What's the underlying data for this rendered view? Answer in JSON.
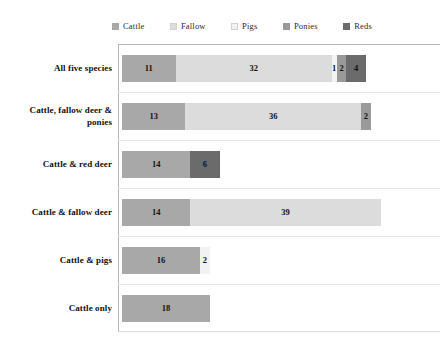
{
  "chart_data": {
    "type": "bar",
    "orientation": "horizontal",
    "stacked": true,
    "title": "",
    "subtitle": "",
    "xlabel": "",
    "ylabel": "",
    "xlim": [
      0,
      66
    ],
    "grid": false,
    "legend_position": "top",
    "categories": [
      "All five species",
      "Cattle, fallow deer & ponies",
      "Cattle & red deer",
      "Cattle & fallow deer",
      "Cattle & pigs",
      "Cattle only"
    ],
    "series": [
      {
        "name": "Cattle",
        "color": "#a8a8a8",
        "values": [
          11,
          13,
          14,
          14,
          16,
          18
        ]
      },
      {
        "name": "Fallow",
        "color": "#dcdcdc",
        "values": [
          32,
          36,
          0,
          39,
          0,
          0
        ]
      },
      {
        "name": "Pigs",
        "color": "#f2f2f2",
        "values": [
          1,
          0,
          0,
          0,
          2,
          0
        ]
      },
      {
        "name": "Ponies",
        "color": "#9a9a9a",
        "values": [
          2,
          2,
          0,
          0,
          0,
          0
        ]
      },
      {
        "name": "Reds",
        "color": "#6b6b6b",
        "values": [
          4,
          0,
          6,
          0,
          0,
          0
        ]
      }
    ],
    "rows": [
      {
        "label": "All five species",
        "segments": [
          {
            "series": "Cattle",
            "value": 11,
            "label": "11",
            "color": "#a8a8a8",
            "label_inside": true
          },
          {
            "series": "Fallow",
            "value": 32,
            "label": "32",
            "color": "#dcdcdc",
            "label_inside": true
          },
          {
            "series": "Pigs",
            "value": 1,
            "label": "1",
            "color": "#f4f4f4",
            "label_inside": true
          },
          {
            "series": "Ponies",
            "value": 2,
            "label": "2",
            "color": "#9a9a9a",
            "label_inside": true
          },
          {
            "series": "Reds",
            "value": 4,
            "label": "4",
            "color": "#6b6b6b",
            "label_inside": true
          }
        ]
      },
      {
        "label": "Cattle, fallow deer & ponies",
        "segments": [
          {
            "series": "Cattle",
            "value": 13,
            "label": "13",
            "color": "#a8a8a8",
            "label_inside": true
          },
          {
            "series": "Fallow",
            "value": 36,
            "label": "36",
            "color": "#dcdcdc",
            "label_inside": true
          },
          {
            "series": "Ponies",
            "value": 2,
            "label": "2",
            "color": "#9a9a9a",
            "label_inside": true
          }
        ]
      },
      {
        "label": "Cattle & red deer",
        "segments": [
          {
            "series": "Cattle",
            "value": 14,
            "label": "14",
            "color": "#a8a8a8",
            "label_inside": true
          },
          {
            "series": "Reds",
            "value": 6,
            "label": "6",
            "color": "#6b6b6b",
            "label_inside": true
          }
        ]
      },
      {
        "label": "Cattle & fallow deer",
        "segments": [
          {
            "series": "Cattle",
            "value": 14,
            "label": "14",
            "color": "#a8a8a8",
            "label_inside": true
          },
          {
            "series": "Fallow",
            "value": 39,
            "label": "39",
            "color": "#dcdcdc",
            "label_inside": true
          }
        ]
      },
      {
        "label": "Cattle & pigs",
        "segments": [
          {
            "series": "Cattle",
            "value": 16,
            "label": "16",
            "color": "#a8a8a8",
            "label_inside": true
          },
          {
            "series": "Pigs",
            "value": 2,
            "label": "2",
            "color": "#f2f2f2",
            "label_inside": true
          }
        ]
      },
      {
        "label": "Cattle only",
        "segments": [
          {
            "series": "Cattle",
            "value": 18,
            "label": "18",
            "color": "#a8a8a8",
            "label_inside": true
          }
        ]
      }
    ]
  },
  "legend": {
    "items": [
      {
        "label": "Cattle",
        "color": "#a8a8a8",
        "icon": "legend-swatch-icon"
      },
      {
        "label": "Fallow",
        "color": "#dcdcdc",
        "icon": "legend-swatch-icon"
      },
      {
        "label": "Pigs",
        "color": "#f2f2f2",
        "icon": "legend-swatch-icon"
      },
      {
        "label": "Ponies",
        "color": "#9a9a9a",
        "icon": "legend-swatch-icon"
      },
      {
        "label": "Reds",
        "color": "#6b6b6b",
        "icon": "legend-swatch-icon"
      }
    ]
  },
  "style": {
    "background": "#ffffff",
    "axis_color": "#b8b8b8",
    "separator_color": "#e6e6e6",
    "text_color": "#111111"
  }
}
